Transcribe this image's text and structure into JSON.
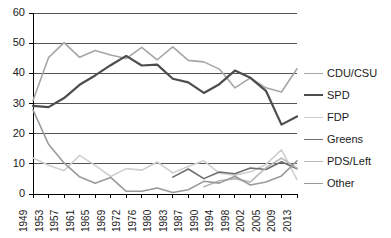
{
  "chart_data": {
    "type": "line",
    "title": "",
    "subtitle": "",
    "xlabel": "",
    "ylabel": "",
    "xlim_years": [
      1949,
      2013
    ],
    "ylim": [
      0,
      60
    ],
    "ytick_step": 10,
    "grid": "horizontal",
    "legend_position": "right",
    "categories": [
      "1949",
      "1953",
      "1957",
      "1961",
      "1965",
      "1969",
      "1972",
      "1976",
      "1980",
      "1983",
      "1987",
      "1990",
      "1994",
      "1998",
      "2002",
      "2005",
      "2009",
      "2013"
    ],
    "yticks": [
      "0",
      "10",
      "20",
      "30",
      "40",
      "50",
      "60"
    ],
    "series": [
      {
        "name": "CDU/CSU",
        "color": "#a6a6a6",
        "width": 1.6,
        "values": [
          31.0,
          45.2,
          50.2,
          45.3,
          47.6,
          46.1,
          44.9,
          48.6,
          44.5,
          48.8,
          44.3,
          43.8,
          41.4,
          35.2,
          38.5,
          35.2,
          33.8,
          41.5
        ]
      },
      {
        "name": "SPD",
        "color": "#4d4d4d",
        "width": 2.2,
        "values": [
          29.2,
          28.8,
          31.8,
          36.2,
          39.3,
          42.7,
          45.8,
          42.6,
          42.9,
          38.2,
          37.0,
          33.5,
          36.4,
          40.9,
          38.5,
          34.2,
          23.0,
          25.7
        ]
      },
      {
        "name": "FDP",
        "color": "#cfcfcf",
        "width": 1.6,
        "values": [
          11.9,
          9.5,
          7.7,
          12.8,
          9.5,
          5.8,
          8.4,
          7.9,
          10.6,
          7.0,
          9.1,
          11.0,
          6.9,
          6.2,
          7.4,
          9.8,
          14.6,
          4.8
        ]
      },
      {
        "name": "Greens",
        "color": "#6e6e6e",
        "width": 1.6,
        "values": [
          null,
          null,
          null,
          null,
          null,
          null,
          null,
          null,
          null,
          5.6,
          8.3,
          5.1,
          7.3,
          6.7,
          8.6,
          8.1,
          10.7,
          8.4
        ]
      },
      {
        "name": "PDS/Left",
        "color": "#b8b8b8",
        "width": 1.6,
        "values": [
          null,
          null,
          null,
          null,
          null,
          null,
          null,
          null,
          null,
          null,
          null,
          2.4,
          4.4,
          5.1,
          4.0,
          8.7,
          11.9,
          8.6
        ]
      },
      {
        "name": "Other",
        "color": "#9a9a9a",
        "width": 1.6,
        "values": [
          27.9,
          16.5,
          10.3,
          5.7,
          3.6,
          5.5,
          0.9,
          0.9,
          2.0,
          0.5,
          1.4,
          4.2,
          3.6,
          5.9,
          3.0,
          4.0,
          6.0,
          11.0
        ]
      }
    ]
  },
  "legend": {
    "items": [
      {
        "label": "CDU/CSU"
      },
      {
        "label": "SPD"
      },
      {
        "label": "FDP"
      },
      {
        "label": "Greens"
      },
      {
        "label": "PDS/Left"
      },
      {
        "label": "Other"
      }
    ]
  }
}
